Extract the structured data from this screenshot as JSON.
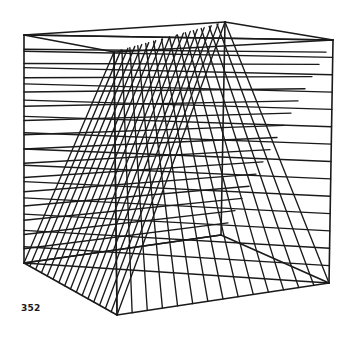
{
  "figure": {
    "label": "352",
    "stroke_color": "#1a1a1a",
    "background": "#ffffff",
    "vertices": {
      "top_left": [
        24,
        35
      ],
      "top_back": [
        225,
        22
      ],
      "top_right": [
        333,
        40
      ],
      "top_front": [
        114,
        52
      ],
      "bottom_left": [
        24,
        263
      ],
      "bottom_back": [
        221,
        235
      ],
      "bottom_right": [
        329,
        283
      ],
      "bottom_front": [
        117,
        315
      ]
    },
    "frame_edges": [
      [
        "top_left",
        "top_back"
      ],
      [
        "top_back",
        "top_right"
      ],
      [
        "top_right",
        "top_front"
      ],
      [
        "top_front",
        "top_left"
      ],
      [
        "bottom_left",
        "bottom_back"
      ],
      [
        "bottom_back",
        "bottom_right"
      ],
      [
        "bottom_right",
        "bottom_front"
      ],
      [
        "bottom_front",
        "bottom_left"
      ],
      [
        "top_left",
        "bottom_left"
      ],
      [
        "top_right",
        "bottom_right"
      ],
      [
        "top_front",
        "bottom_front"
      ],
      [
        "top_back",
        "bottom_back"
      ]
    ],
    "fans": [
      {
        "name": "fan-front",
        "from": [
          "top_front",
          "top_back"
        ],
        "to": [
          "bottom_left",
          "bottom_front"
        ],
        "count": 16
      },
      {
        "name": "fan-back",
        "from": [
          "top_left",
          "bottom_left"
        ],
        "to": [
          "top_right",
          "bottom_back"
        ],
        "count": 16
      },
      {
        "name": "fan-right",
        "from": [
          "top_front",
          "top_back"
        ],
        "to": [
          "bottom_front",
          "bottom_right"
        ],
        "count": 14
      },
      {
        "name": "fan-left-diag",
        "from": [
          "top_left",
          "bottom_left"
        ],
        "to": [
          "top_right",
          "bottom_right"
        ],
        "count": 14
      }
    ]
  }
}
